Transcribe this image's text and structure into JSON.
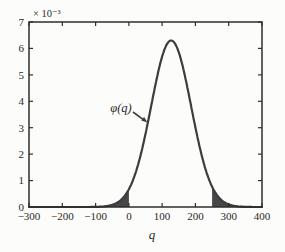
{
  "chart_data": {
    "type": "area",
    "title": "",
    "xlabel": "q",
    "ylabel": "",
    "exponent_label": "× 10⁻³",
    "curve_label": "φ(q)",
    "xlim": [
      -300,
      400
    ],
    "ylim": [
      0,
      0.007
    ],
    "grid": false,
    "box": true,
    "xticks": [
      "−300",
      "−200",
      "−100",
      "0",
      "100",
      "200",
      "300",
      "400"
    ],
    "xtick_values": [
      -300,
      -200,
      -100,
      0,
      100,
      200,
      300,
      400
    ],
    "yticks": [
      "0",
      "1",
      "2",
      "3",
      "4",
      "5",
      "6",
      "7"
    ],
    "ytick_values": [
      0,
      0.001,
      0.002,
      0.003,
      0.004,
      0.005,
      0.006,
      0.007
    ],
    "gaussian": {
      "mean": 127,
      "sigma": 60,
      "peak": 0.0063
    },
    "shaded_regions": [
      {
        "from": -300,
        "to": 0
      },
      {
        "from": 250,
        "to": 400
      }
    ],
    "sample_points": [
      [
        -300,
        0.0
      ],
      [
        -200,
        0.0
      ],
      [
        -100,
        5.6e-06
      ],
      [
        -50,
        9e-05
      ],
      [
        0,
        0.00067
      ],
      [
        50,
        0.00288
      ],
      [
        100,
        0.00578
      ],
      [
        127,
        0.0063
      ],
      [
        150,
        0.00578
      ],
      [
        200,
        0.00288
      ],
      [
        250,
        0.00077
      ],
      [
        300,
        9e-05
      ],
      [
        350,
        5.6e-06
      ],
      [
        400,
        0.0
      ]
    ],
    "colors": {
      "curve": "#3d3d3d",
      "fill": "#474747",
      "axis": "#2e2e2e",
      "text": "#2a2a2a",
      "background": "#fcfcfa"
    }
  }
}
